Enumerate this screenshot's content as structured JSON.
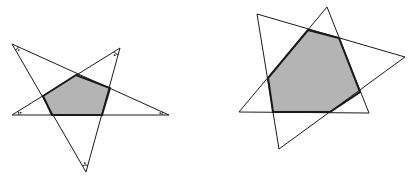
{
  "figures": [
    {
      "name": "pentagram",
      "description": "Five-pointed star with shaded inner pentagon and marked vertex angles",
      "vertices": [
        [
          12,
          44
        ],
        [
          169,
          115
        ],
        [
          12,
          115
        ],
        [
          120,
          48
        ],
        [
          86,
          172
        ]
      ],
      "inner_polygon": [
        [
          76,
          75
        ],
        [
          110,
          88
        ],
        [
          102,
          115
        ],
        [
          52,
          115
        ],
        [
          43,
          96
        ]
      ],
      "angle_marks": [
        [
          12,
          44
        ],
        [
          120,
          48
        ],
        [
          12,
          115
        ],
        [
          169,
          115
        ],
        [
          86,
          172
        ]
      ],
      "colors": {
        "stroke": "#1a1a1a",
        "fill": "#b4b4b4"
      }
    },
    {
      "name": "two-triangles",
      "description": "Two overlapping triangles forming a shaded hexagon",
      "triangle_a": [
        [
          257,
          14
        ],
        [
          405,
          57
        ],
        [
          279,
          149
        ]
      ],
      "triangle_b": [
        [
          327,
          7
        ],
        [
          369,
          113
        ],
        [
          239,
          112
        ]
      ],
      "inner_polygon": [
        [
          308,
          30
        ],
        [
          339,
          38
        ],
        [
          360,
          92
        ],
        [
          330,
          112
        ],
        [
          273,
          112
        ],
        [
          268,
          78
        ]
      ],
      "colors": {
        "stroke": "#1a1a1a",
        "fill": "#b4b4b4"
      }
    }
  ]
}
